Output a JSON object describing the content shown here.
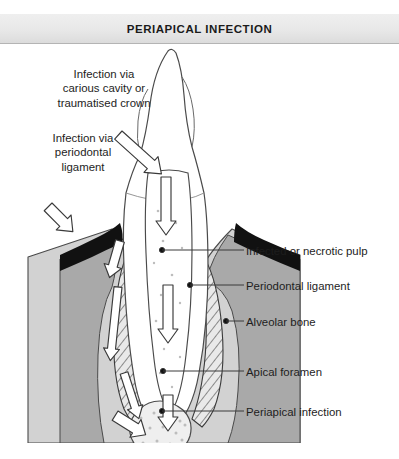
{
  "title": "PERIAPICAL INFECTION",
  "figure": {
    "caption_alt": "Cross-section of a tooth showing routes of periapical infection",
    "left_labels": [
      {
        "id": "carious",
        "lines": [
          "Infection via",
          "carious cavity or",
          "traumatised crown"
        ]
      },
      {
        "id": "periodontal",
        "lines": [
          "Infection via",
          "periodontal",
          "ligament"
        ]
      }
    ],
    "right_labels": [
      {
        "id": "pulp",
        "text": "Infected or necrotic pulp"
      },
      {
        "id": "pdl",
        "text": "Periodontal ligament"
      },
      {
        "id": "bone",
        "text": "Alveolar bone"
      },
      {
        "id": "foramen",
        "text": "Apical foramen"
      },
      {
        "id": "lesion",
        "text": "Periapical infection"
      }
    ],
    "arrows": [
      {
        "id": "arrow-carious-crown",
        "direction": "down-right"
      },
      {
        "id": "arrow-pulp-upper",
        "direction": "down"
      },
      {
        "id": "arrow-pulp-lower",
        "direction": "down"
      },
      {
        "id": "arrow-periodontal-entry",
        "direction": "down-right"
      },
      {
        "id": "arrow-pdl-sulcus",
        "direction": "down"
      },
      {
        "id": "arrow-pdl-mid",
        "direction": "down"
      },
      {
        "id": "arrow-pdl-apex",
        "direction": "down-right"
      },
      {
        "id": "arrow-foramen-exit",
        "direction": "down"
      }
    ]
  },
  "colors": {
    "banner_top": "#efefef",
    "banner_bottom": "#dcdcdc",
    "banner_rule": "#b4b4b4",
    "text": "#1d1d1d",
    "outline": "#3a3a3a",
    "gingiva": "#111111",
    "bone_outer": "#d2d2d2",
    "bone_inner": "#a9a9a9",
    "tooth_fill": "#ffffff",
    "lesion_fill": "#efefef",
    "stipple": "#b9b9b9",
    "page_bg": "#ffffff"
  }
}
